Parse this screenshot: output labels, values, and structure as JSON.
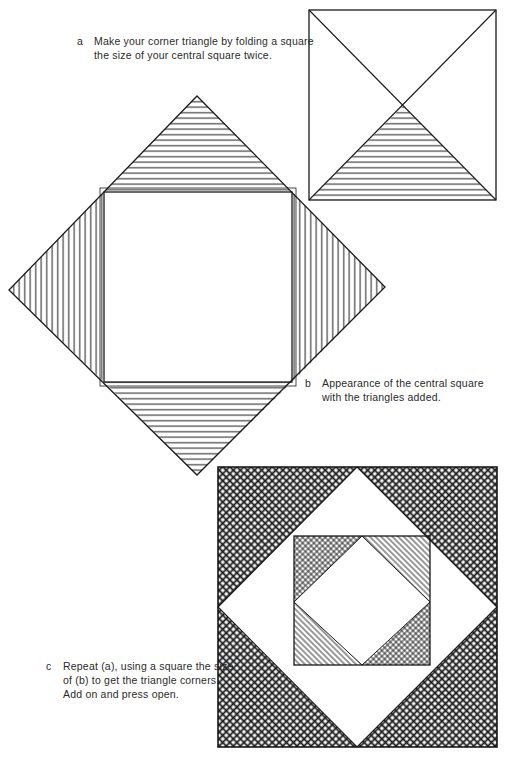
{
  "figures": {
    "a": {
      "letter": "a",
      "caption": "Make your corner triangle by folding a square the size of your central square twice."
    },
    "b": {
      "letter": "b",
      "caption": "Appearance of the central square with the triangles added."
    },
    "c": {
      "letter": "c",
      "caption": "Repeat (a), using a square the size of (b) to get the triangle corners. Add on and press open."
    }
  },
  "colors": {
    "ink": "#1a1a1a",
    "paper": "#ffffff"
  }
}
